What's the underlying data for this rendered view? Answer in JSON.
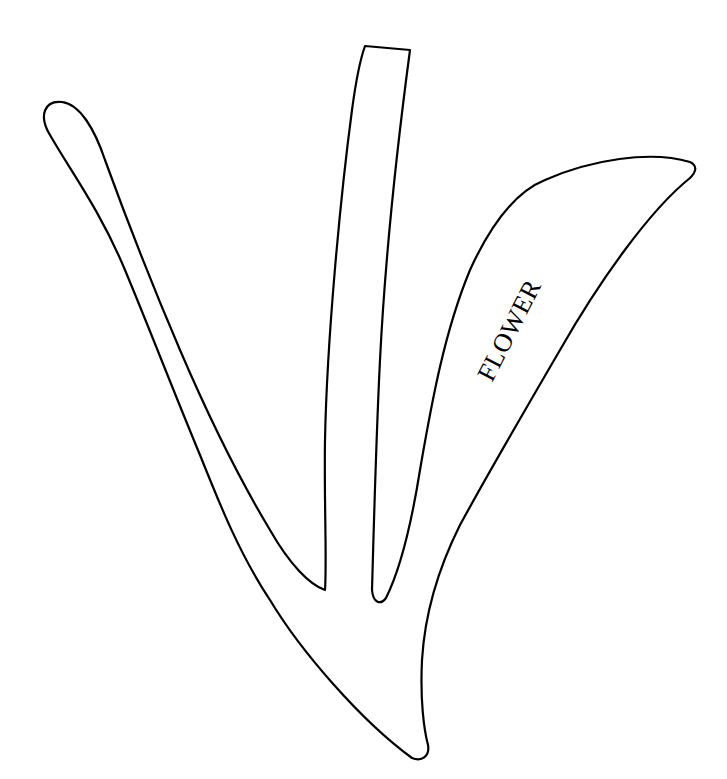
{
  "figure": {
    "type": "line-drawing",
    "stroke_color": "#000000",
    "background_color": "#ffffff",
    "labels": {
      "flower": "FLOWER"
    },
    "parts": [
      "left-leaf",
      "center-stem",
      "flower-petal",
      "base"
    ]
  }
}
